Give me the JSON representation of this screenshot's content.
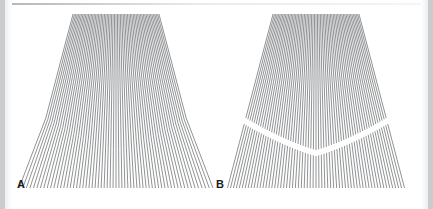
{
  "figure": {
    "caption_labels": [
      "A",
      "B"
    ],
    "background_color": "#ffffff",
    "line_color": "#6b6d70",
    "edge_border_color": "#c9cbcd",
    "label_color": "#1b1b1b",
    "width": 433,
    "height": 209
  },
  "panels": [
    {
      "id": "A",
      "label": "A",
      "continuity": "continuous-bent",
      "description": "Radial fan of thin gray lines that bend at a junction contour, remaining continuous across it.",
      "line_count": 61,
      "junction_gap": 0,
      "vanishing_point": {
        "x": 102,
        "y": -150
      },
      "fan_top_y": 14,
      "fan_bottom_y": 188,
      "fan_left_x": 20,
      "fan_right_x": 197,
      "junction_center_y": 150,
      "junction_edge_y": 118,
      "bend_strength": 0.46
    },
    {
      "id": "B",
      "label": "B",
      "continuity": "broken-segments",
      "description": "Radial fan of thin gray lines split into separate upper and lower segments with visible gaps at the junction.",
      "line_count": 61,
      "junction_gap": 6,
      "vanishing_point": {
        "x": 102,
        "y": -150
      },
      "fan_top_y": 14,
      "fan_bottom_y": 188,
      "fan_left_x": 20,
      "fan_right_x": 197,
      "junction_center_y": 150,
      "junction_edge_y": 118,
      "bend_strength": 0.0
    }
  ],
  "chart_data": {
    "type": "line",
    "title": "",
    "xlabel": "",
    "ylabel": "",
    "grid": false,
    "legend": "none",
    "series": [
      {
        "name": "A",
        "values": [
          61
        ],
        "note": "continuous bent lines"
      },
      {
        "name": "B",
        "values": [
          61
        ],
        "note": "broken line segments"
      }
    ]
  }
}
